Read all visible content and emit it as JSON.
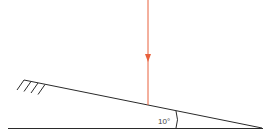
{
  "diagram": {
    "angle_label": "10°",
    "colors": {
      "line": "#2a2a2a",
      "force_arrow": "#e8603c",
      "background": "#ffffff"
    },
    "elements": [
      "inclined-plane",
      "ground-line",
      "wall-hatch",
      "force-arrow",
      "angle-arc"
    ]
  }
}
